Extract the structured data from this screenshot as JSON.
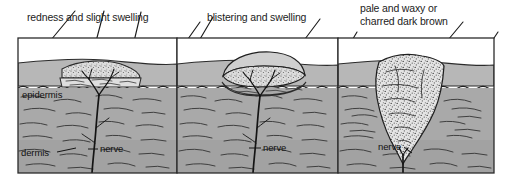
{
  "figure": {
    "panel_count": 3,
    "frame_color": "#2b2b2b",
    "colors": {
      "air": "#ffffff",
      "epidermis": "#b4b4b4",
      "dermis": "#a8a8a8",
      "dermis_deep": "#9e9e9e",
      "ink": "#1c1c1c",
      "wound_light": "#d8d8d8",
      "eschar": "#e2e2e2"
    }
  },
  "panels": [
    {
      "id": "panel-superficial",
      "caption": "redness and slight swelling",
      "caption_lines": [
        "redness and slight swelling"
      ],
      "leader_count": 3,
      "labels": [
        {
          "name": "epidermis",
          "text": "epidermis"
        },
        {
          "name": "dermis",
          "text": "dermis"
        },
        {
          "name": "nerve",
          "text": "nerve"
        }
      ]
    },
    {
      "id": "panel-partial-thickness",
      "caption": "blistering and swelling",
      "caption_lines": [
        "blistering and swelling"
      ],
      "leader_count": 3,
      "labels": [
        {
          "name": "nerve",
          "text": "nerve"
        }
      ]
    },
    {
      "id": "panel-full-thickness",
      "caption": "pale and waxy or charred dark brown",
      "caption_lines": [
        "pale and waxy or",
        "charred dark brown"
      ],
      "leader_count": 3,
      "labels": [
        {
          "name": "nerve",
          "text": "nerve"
        }
      ]
    }
  ],
  "captions": {
    "panel1": "redness and slight swelling",
    "panel2": "blistering and swelling",
    "panel3_line1": "pale and waxy or",
    "panel3_line2": "charred dark brown"
  },
  "anatomy": {
    "epidermis": "epidermis",
    "dermis": "dermis",
    "nerve1": "nerve",
    "nerve2": "nerve",
    "nerve3": "nerve"
  }
}
